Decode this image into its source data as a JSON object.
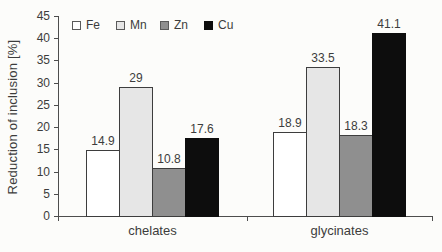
{
  "figure": {
    "background": "#fcfcfa"
  },
  "chart_data": {
    "type": "bar",
    "title": "",
    "xlabel": "",
    "ylabel": "Reduction of inclusion [%]",
    "categories": [
      "chelates",
      "glycinates"
    ],
    "series": [
      {
        "name": "Fe",
        "values": [
          14.9,
          18.9
        ],
        "fill": "#ffffff"
      },
      {
        "name": "Mn",
        "values": [
          29,
          33.5
        ],
        "fill": "#e6e6e6"
      },
      {
        "name": "Zn",
        "values": [
          10.8,
          18.3
        ],
        "fill": "#8f8f8f"
      },
      {
        "name": "Cu",
        "values": [
          17.6,
          41.1
        ],
        "fill": "#0d0d0d"
      }
    ],
    "value_labels": [
      [
        "14.9",
        "29",
        "10.8",
        "17.6"
      ],
      [
        "18.9",
        "33.5",
        "18.3",
        "41.1"
      ]
    ],
    "ylim": [
      0,
      45
    ],
    "ytick_step": 5,
    "ytick_labels": [
      "0",
      "5",
      "10",
      "15",
      "20",
      "25",
      "30",
      "35",
      "40",
      "45"
    ],
    "legend_position": "top",
    "grid": false,
    "colors": {
      "axis": "#4d4d4d",
      "text": "#3c3c3c",
      "bar_border": "#3d3d3d"
    }
  }
}
